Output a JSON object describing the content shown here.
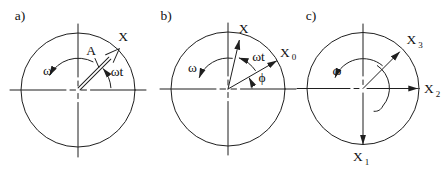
{
  "colors": {
    "background": "#ffffff",
    "stroke": "#1f1f1f",
    "text": "#111111"
  },
  "panels": {
    "a": {
      "panel_label": "a)",
      "labels": {
        "vector": "X",
        "amplitude": "A",
        "omega": "ω",
        "omega_t": "ωt"
      }
    },
    "b": {
      "panel_label": "b)",
      "labels": {
        "vector": "X",
        "x0": {
          "base": "X",
          "sub": "0"
        },
        "omega": "ω",
        "omega_t": "ωt",
        "phi": "ϕ"
      }
    },
    "c": {
      "panel_label": "c)",
      "labels": {
        "x3": {
          "base": "X",
          "sub": "3"
        },
        "x2": {
          "base": "X",
          "sub": "2"
        },
        "x1": {
          "base": "X",
          "sub": "1"
        },
        "omega": "ω"
      }
    }
  }
}
